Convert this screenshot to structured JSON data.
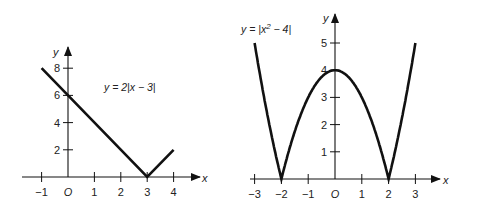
{
  "chart_data": [
    {
      "type": "line",
      "title": "y = 2|x − 3|",
      "equation_label": "y = 2|x − 3|",
      "xlabel": "x",
      "ylabel": "y",
      "xlim": [
        -1.5,
        4.9
      ],
      "ylim": [
        0,
        9.5
      ],
      "xticks": [
        -1,
        0,
        1,
        2,
        3,
        4
      ],
      "xtick_labels": [
        "−1",
        "O",
        "1",
        "2",
        "3",
        "4"
      ],
      "yticks": [
        2,
        4,
        6,
        8
      ],
      "ytick_labels": [
        "2",
        "4",
        "6",
        "8"
      ],
      "grid": false,
      "series": [
        {
          "name": "y = 2|x − 3|",
          "x": [
            -1,
            3,
            4
          ],
          "y": [
            8,
            0,
            2
          ]
        }
      ]
    },
    {
      "type": "line",
      "title": "y = |x² − 4|",
      "equation_label": "y = |x",
      "equation_exponent": "2",
      "equation_tail": " − 4|",
      "xlabel": "x",
      "ylabel": "y",
      "xlim": [
        -3.3,
        3.9
      ],
      "ylim": [
        0,
        5.8
      ],
      "xticks": [
        -3,
        -2,
        -1,
        0,
        1,
        2,
        3
      ],
      "xtick_labels": [
        "−3",
        "−2",
        "−1",
        "O",
        "1",
        "2",
        "3"
      ],
      "yticks": [
        1,
        2,
        3,
        4,
        5
      ],
      "ytick_labels": [
        "1",
        "2",
        "3",
        "4",
        "5"
      ],
      "grid": false,
      "series": [
        {
          "name": "y = |x² − 4|",
          "function": "abs(x^2 - 4)",
          "x_range": [
            -3,
            3
          ]
        }
      ]
    }
  ]
}
